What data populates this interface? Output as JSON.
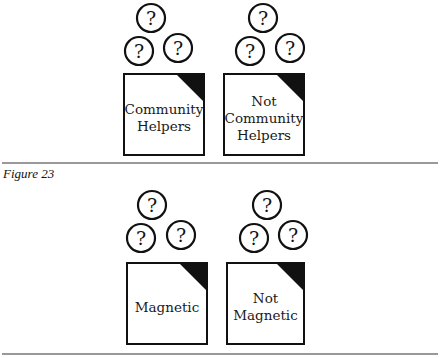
{
  "figures": [
    {
      "caption": "Figure 23",
      "boxes": [
        {
          "label_lines": [
            "Community",
            "Helpers"
          ],
          "question_marks": [
            "?",
            "?",
            "?"
          ]
        },
        {
          "label_lines": [
            "Not",
            "Community",
            "Helpers"
          ],
          "question_marks": [
            "?",
            "?",
            "?"
          ]
        }
      ]
    },
    {
      "caption": "",
      "boxes": [
        {
          "label_lines": [
            "Magnetic"
          ],
          "question_marks": [
            "?",
            "?",
            "?"
          ]
        },
        {
          "label_lines": [
            "Not",
            "Magnetic"
          ],
          "question_marks": [
            "?",
            "?",
            "?"
          ]
        }
      ]
    }
  ],
  "colors": {
    "ink": "#111111",
    "rule": "#777777"
  }
}
